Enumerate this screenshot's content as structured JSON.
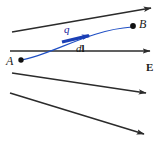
{
  "figure": {
    "colors": {
      "field_line": "#2b2b2b",
      "path": "#1f4fc4",
      "displacement_vector": "#1b3fb5",
      "charge_label": "#15179b",
      "point_marker": "#111111",
      "background": "#ffffff"
    },
    "labels": {
      "point_a": "A",
      "point_b": "B",
      "field": "E",
      "charge": "q",
      "displacement_d": "d",
      "displacement_l": "l"
    },
    "field_lines": [
      {
        "name": "field-line-1",
        "x1": 12,
        "y1": 32,
        "x2": 151,
        "y2": 8
      },
      {
        "name": "field-line-2",
        "x1": 10,
        "y1": 51,
        "x2": 150,
        "y2": 51
      },
      {
        "name": "field-line-3",
        "x1": 12,
        "y1": 73,
        "x2": 146,
        "y2": 93
      },
      {
        "name": "field-line-4",
        "x1": 10,
        "y1": 93,
        "x2": 144,
        "y2": 134
      }
    ],
    "path": {
      "name": "charge-path",
      "start": [
        21,
        60
      ],
      "end": [
        132,
        27
      ],
      "control1": [
        52,
        55
      ],
      "control2": [
        88,
        30
      ]
    },
    "displacement_vector": {
      "name": "displacement-vector",
      "x1": 62,
      "y1": 42,
      "x2": 91,
      "y2": 35
    },
    "points": [
      {
        "name": "point-a-marker",
        "cx": 21,
        "cy": 60,
        "r": 2.6
      },
      {
        "name": "point-b-marker",
        "cx": 133,
        "cy": 26,
        "r": 2.8
      }
    ]
  }
}
